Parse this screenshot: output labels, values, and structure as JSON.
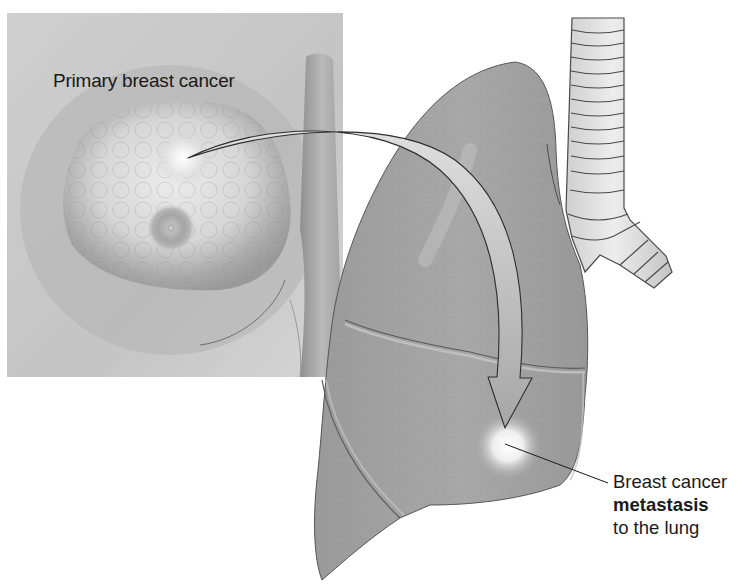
{
  "figure": {
    "title": "Breast cancer metastasis to the lung",
    "colors": {
      "background": "#ffffff",
      "skin_panel": "#c9c9c9",
      "lung": "#9e9e9e",
      "trachea": "#d9d9d9",
      "outline": "#3a3a3a",
      "tumor_glow": "#f5f5f5",
      "text": "#1a1a1a"
    }
  },
  "labels": {
    "primary": "Primary breast cancer",
    "metastasis_line1": "Breast cancer",
    "metastasis_line2": "metastasis",
    "metastasis_line3": "to the lung"
  },
  "elements": {
    "breast_panel": "breast-illustration",
    "arrow": "curved-spread-arrow",
    "lung": "lung-illustration",
    "trachea": "trachea-illustration",
    "leader_line": "metastasis-leader-line"
  }
}
